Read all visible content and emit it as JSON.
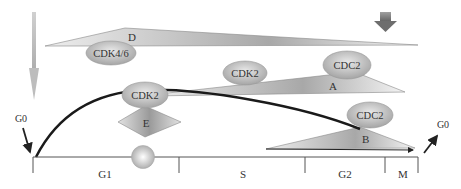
{
  "diagram": {
    "phases": [
      {
        "label": "G1",
        "x": 105
      },
      {
        "label": "S",
        "x": 243
      },
      {
        "label": "G2",
        "x": 345
      },
      {
        "label": "M",
        "x": 403
      }
    ],
    "g0_entry_label": "G0",
    "g0_exit_label": "G0",
    "cyclins": {
      "d": "D",
      "e": "E",
      "a": "A",
      "b": "B"
    },
    "kinases": {
      "cdk46": "CDK4/6",
      "cdk2_e": "CDK2",
      "cdk2_a": "CDK2",
      "cdc2_a": "CDC2",
      "cdc2_b": "CDC2"
    }
  }
}
